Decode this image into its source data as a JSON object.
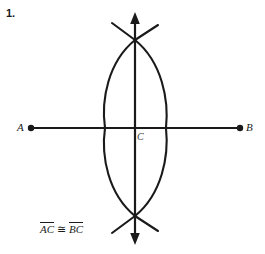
{
  "problem": {
    "number": "1."
  },
  "figure": {
    "type": "perpendicular-bisector-construction",
    "stroke_color": "#1a1a1a",
    "background_color": "#ffffff",
    "points": [
      {
        "name": "A",
        "label": "A",
        "x": 31,
        "y": 128,
        "marker": "filled-dot"
      },
      {
        "name": "B",
        "label": "B",
        "x": 240,
        "y": 128,
        "marker": "filled-dot"
      },
      {
        "name": "C",
        "label": "C",
        "x": 135,
        "y": 128,
        "marker": "none"
      }
    ],
    "segment_AB": {
      "x1": 31,
      "y1": 128,
      "x2": 240,
      "y2": 128
    },
    "vertical_line": {
      "x": 135,
      "y_top": 14,
      "y_bottom": 243,
      "arrows": "both"
    },
    "arc_left": {
      "center_x": 240,
      "radius": 135,
      "top_y": 40,
      "bottom_y": 216,
      "extreme_x": 105
    },
    "arc_right": {
      "center_x": 31,
      "radius": 135,
      "top_y": 40,
      "bottom_y": 216,
      "extreme_x": 166
    },
    "arc_intersections": [
      {
        "x": 135,
        "y": 40
      },
      {
        "x": 135,
        "y": 216
      }
    ],
    "tick_marks_top": {
      "cross_x": 135,
      "cross_y": 40,
      "span_left_x": 112,
      "span_right_x": 158,
      "tip_y": 23
    },
    "tick_marks_bottom": {
      "cross_x": 135,
      "cross_y": 216,
      "span_left_x": 112,
      "span_right_x": 158,
      "tip_y": 233
    }
  },
  "caption": {
    "left_segment": "AC",
    "relation": "≅",
    "right_segment": "BC",
    "full_text": "AC ≅ BC"
  }
}
